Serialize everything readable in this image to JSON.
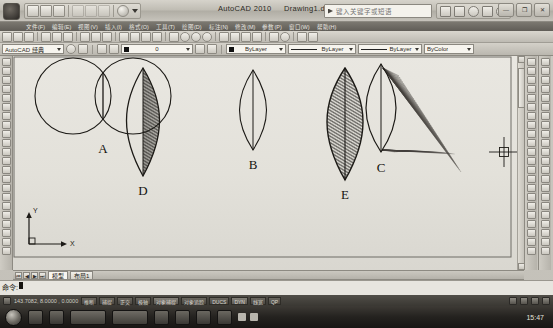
{
  "window": {
    "app_title": "AutoCAD 2010",
    "document_title": "Drawing1.dwg",
    "minimize_label": "—",
    "restore_label": "❐",
    "close_label": "✕"
  },
  "search": {
    "placeholder": "键入关键字或短语",
    "value": ""
  },
  "menu": {
    "items": [
      {
        "label": "文件(F)"
      },
      {
        "label": "编辑(E)"
      },
      {
        "label": "视图(V)"
      },
      {
        "label": "插入(I)"
      },
      {
        "label": "格式(O)"
      },
      {
        "label": "工具(T)"
      },
      {
        "label": "绘图(D)"
      },
      {
        "label": "标注(N)"
      },
      {
        "label": "修改(M)"
      },
      {
        "label": "参数(P)"
      },
      {
        "label": "窗口(W)"
      },
      {
        "label": "帮助(H)"
      }
    ]
  },
  "properties_toolbar": {
    "workspace": {
      "label": "AutoCAD 经典",
      "name": "workspace-select"
    },
    "layer": {
      "label": "0",
      "name": "layer-select"
    },
    "color": {
      "label": "ByLayer",
      "name": "color-select"
    },
    "linetype": {
      "label": "ByLayer",
      "name": "linetype-select"
    },
    "lineweight": {
      "label": "ByLayer",
      "name": "lineweight-select"
    },
    "plotstyle": {
      "label": "ByColor",
      "name": "plotstyle-select"
    }
  },
  "drawing": {
    "shapes": [
      {
        "id": "A",
        "label": "A",
        "kind": "two-overlapping-circles-with-chord"
      },
      {
        "id": "B",
        "label": "B",
        "kind": "lens-outline-with-chord"
      },
      {
        "id": "C",
        "label": "C",
        "kind": "lens-with-radial-fan-hatch"
      },
      {
        "id": "D",
        "label": "D",
        "kind": "lens-half-hatched"
      },
      {
        "id": "E",
        "label": "E",
        "kind": "lens-fully-hatched"
      }
    ],
    "ucs": {
      "x_label": "X",
      "y_label": "Y"
    }
  },
  "layout_tabs": {
    "nav": [
      {
        "label": "⏮"
      },
      {
        "label": "◀"
      },
      {
        "label": "▶"
      },
      {
        "label": "⏭"
      }
    ],
    "tabs": [
      {
        "label": "模型",
        "active": true
      },
      {
        "label": "布局1",
        "active": false
      }
    ]
  },
  "command_line": {
    "prompt": "命令:",
    "value": ""
  },
  "status_bar": {
    "coordinates": "143.7082, 8.0000 , 0.0000",
    "toggles": [
      {
        "label": "推断",
        "on": false
      },
      {
        "label": "捕捉",
        "on": false
      },
      {
        "label": "正交",
        "on": false
      },
      {
        "label": "极轴",
        "on": false
      },
      {
        "label": "对象捕捉",
        "on": true
      },
      {
        "label": "对象追踪",
        "on": false
      },
      {
        "label": "DUCS",
        "on": false
      },
      {
        "label": "DYN",
        "on": true
      },
      {
        "label": "线宽",
        "on": false
      },
      {
        "label": "QP",
        "on": false
      }
    ]
  },
  "taskbar": {
    "windows": [
      {
        "label": "AutoCAD"
      },
      {
        "label": "文档"
      }
    ],
    "clock": "15:47"
  },
  "colors": {
    "canvas_bg": "#e6e4de",
    "ink": "#15130f",
    "chrome": "#c3c0b8",
    "status_bg": "#3a3833",
    "taskbar_bg": "#24221f"
  }
}
